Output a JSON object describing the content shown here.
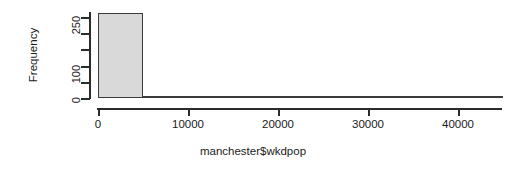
{
  "chart_data": {
    "type": "bar",
    "title": "",
    "subtitle": "",
    "xlabel": "manchester$wkdpop",
    "ylabel": "Frequency",
    "xlim": [
      0,
      44667
    ],
    "ylim": [
      0,
      272
    ],
    "grid": false,
    "legend": null,
    "bin_width": 5000,
    "categories": [
      "0-5000",
      "5000-10000",
      "10000-15000",
      "15000-20000",
      "20000-25000",
      "25000-30000",
      "30000-35000",
      "35000-40000",
      "40000-45000"
    ],
    "bin_edges": [
      0,
      5000,
      10000,
      15000,
      20000,
      25000,
      30000,
      35000,
      40000,
      45000
    ],
    "values": [
      262,
      7,
      3,
      2,
      1,
      0,
      0,
      0,
      1
    ],
    "xticks": [
      {
        "value": 0,
        "label": "0"
      },
      {
        "value": 10000,
        "label": "10000"
      },
      {
        "value": 20000,
        "label": "20000"
      },
      {
        "value": 30000,
        "label": "30000"
      },
      {
        "value": 40000,
        "label": "40000"
      }
    ],
    "yticks": [
      {
        "value": 0,
        "label": "0",
        "major": true
      },
      {
        "value": 50,
        "label": "",
        "major": false
      },
      {
        "value": 100,
        "label": "100",
        "major": true
      },
      {
        "value": 150,
        "label": "",
        "major": false
      },
      {
        "value": 200,
        "label": "",
        "major": false
      },
      {
        "value": 250,
        "label": "250",
        "major": true
      }
    ],
    "colors": {
      "bar_fill": "#d9d9d9",
      "bar_border": "#3b3b3b",
      "axis": "#2b2b2b",
      "text": "#1a1a1a",
      "background": "#ffffff"
    }
  }
}
